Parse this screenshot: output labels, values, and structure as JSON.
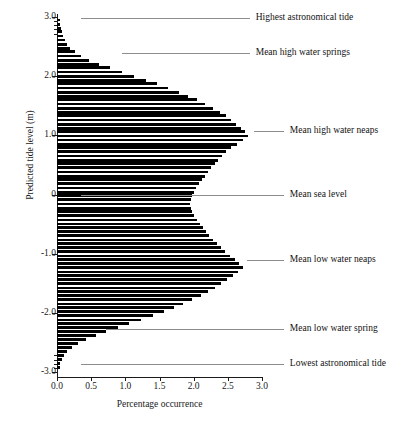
{
  "chart_data": {
    "type": "bar",
    "orientation": "horizontal",
    "title": "",
    "xlabel": "Percentage occurrence",
    "ylabel": "Predicted tide level (m)",
    "xlim": [
      0.0,
      3.0
    ],
    "ylim": [
      -3.0,
      3.0
    ],
    "grid": false,
    "legend": null,
    "xticks": [
      "0.0",
      "0.5",
      "1.0",
      "1.5",
      "2.0",
      "2.5",
      "3.0"
    ],
    "xtick_values": [
      0.0,
      0.5,
      1.0,
      1.5,
      2.0,
      2.5,
      3.0
    ],
    "yticks": [
      "3.0",
      "2.0",
      "1.0",
      "0",
      "-1.0",
      "-2.0",
      "-3.0"
    ],
    "ytick_values": [
      3.0,
      2.0,
      1.0,
      0,
      -1.0,
      -2.0,
      -3.0
    ],
    "bin_width": 0.0674,
    "categories": [
      2.95,
      2.88,
      2.81,
      2.75,
      2.68,
      2.61,
      2.54,
      2.47,
      2.41,
      2.34,
      2.27,
      2.2,
      2.14,
      2.07,
      2.0,
      1.93,
      1.87,
      1.8,
      1.73,
      1.66,
      1.6,
      1.53,
      1.46,
      1.39,
      1.33,
      1.26,
      1.19,
      1.12,
      1.06,
      0.99,
      0.92,
      0.85,
      0.79,
      0.72,
      0.65,
      0.58,
      0.52,
      0.45,
      0.38,
      0.31,
      0.25,
      0.18,
      0.11,
      0.04,
      -0.02,
      -0.09,
      -0.16,
      -0.23,
      -0.29,
      -0.36,
      -0.43,
      -0.5,
      -0.56,
      -0.63,
      -0.7,
      -0.77,
      -0.83,
      -0.9,
      -0.97,
      -1.04,
      -1.1,
      -1.17,
      -1.24,
      -1.31,
      -1.37,
      -1.44,
      -1.51,
      -1.58,
      -1.64,
      -1.71,
      -1.78,
      -1.85,
      -1.91,
      -1.98,
      -2.05,
      -2.12,
      -2.18,
      -2.25,
      -2.32,
      -2.39,
      -2.45,
      -2.52,
      -2.59,
      -2.66,
      -2.72,
      -2.79,
      -2.86,
      -2.93
    ],
    "values": [
      0.04,
      0.05,
      0.06,
      0.07,
      0.09,
      0.11,
      0.14,
      0.19,
      0.26,
      0.35,
      0.47,
      0.62,
      0.78,
      0.95,
      1.12,
      1.3,
      1.47,
      1.63,
      1.78,
      1.92,
      2.05,
      2.17,
      2.28,
      2.38,
      2.47,
      2.55,
      2.62,
      2.69,
      2.75,
      2.8,
      2.72,
      2.63,
      2.55,
      2.48,
      2.42,
      2.36,
      2.31,
      2.26,
      2.21,
      2.16,
      2.12,
      2.08,
      2.04,
      2.01,
      1.98,
      1.96,
      1.95,
      1.96,
      1.98,
      2.01,
      2.05,
      2.09,
      2.13,
      2.18,
      2.23,
      2.28,
      2.34,
      2.4,
      2.46,
      2.53,
      2.6,
      2.67,
      2.72,
      2.65,
      2.57,
      2.49,
      2.4,
      2.31,
      2.21,
      2.1,
      1.98,
      1.85,
      1.71,
      1.56,
      1.4,
      1.23,
      1.06,
      0.89,
      0.72,
      0.57,
      0.43,
      0.31,
      0.22,
      0.15,
      0.1,
      0.07,
      0.05,
      0.04
    ],
    "annotations": [
      {
        "label": "Highest astronomical tide",
        "level": 2.98,
        "line_from": 0.35,
        "line_to": 2.82
      },
      {
        "label": "Mean high water springs",
        "level": 2.4,
        "line_from": 0.95,
        "line_to": 2.82
      },
      {
        "label": "Mean high water neaps",
        "level": 1.07,
        "line_from": 2.88,
        "line_to": 3.32
      },
      {
        "label": "Mean sea level",
        "level": 0.0,
        "line_from": 0.35,
        "line_to": 3.32
      },
      {
        "label": "Mean low water neaps",
        "level": -1.1,
        "line_from": 2.78,
        "line_to": 3.32
      },
      {
        "label": "Mean  low water spring",
        "level": -2.27,
        "line_from": 0.72,
        "line_to": 3.32
      },
      {
        "label": "Lowest astronomical tide",
        "level": -2.86,
        "line_from": 0.35,
        "line_to": 3.32
      }
    ]
  }
}
